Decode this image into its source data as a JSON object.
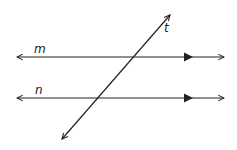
{
  "diagram": {
    "labels": {
      "line_m": "m",
      "line_n": "n",
      "transversal": "t"
    },
    "colors": {
      "stroke": "#222222",
      "background": "#ffffff"
    }
  }
}
